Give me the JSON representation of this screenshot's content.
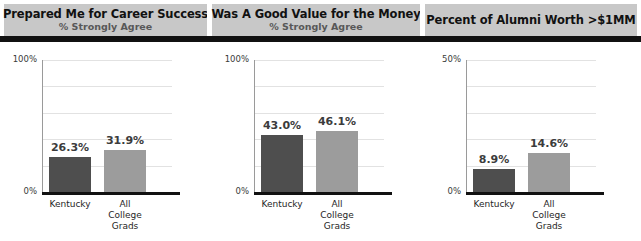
{
  "panels": [
    {
      "title": "Prepared Me for Career Success",
      "subtitle": "% Strongly Agree"
    },
    {
      "title": "Was A Good Value for the Money",
      "subtitle": "% Strongly Agree"
    },
    {
      "title": "Percent of Alumni Worth >$1MM",
      "subtitle": ""
    }
  ],
  "colors": {
    "header_background": "#c8c8c8",
    "header_rule": "#111111",
    "bar_kentucky": "#4e4e4e",
    "bar_all_college_grads": "#9c9c9c",
    "gridline": "#e2e2e2",
    "axis": "#111111"
  },
  "chart_data": [
    {
      "type": "bar",
      "title": "Prepared Me for Career Success",
      "subtitle": "% Strongly Agree",
      "categories": [
        "Kentucky",
        "All College Grads"
      ],
      "category_lines": [
        [
          "Kentucky"
        ],
        [
          "All",
          "College",
          "Grads"
        ]
      ],
      "values": [
        26.3,
        31.9
      ],
      "value_labels": [
        "26.3%",
        "31.9%"
      ],
      "ylim": [
        0,
        100
      ],
      "ytick_labels": [
        "0%",
        "100%"
      ],
      "yticks": [
        0,
        100
      ],
      "gridlines": [
        20,
        40,
        60,
        80,
        100
      ],
      "grid": true,
      "legend": "none",
      "xlabel": "",
      "ylabel": ""
    },
    {
      "type": "bar",
      "title": "Was A Good Value for the Money",
      "subtitle": "% Strongly Agree",
      "categories": [
        "Kentucky",
        "All College Grads"
      ],
      "category_lines": [
        [
          "Kentucky"
        ],
        [
          "All",
          "College",
          "Grads"
        ]
      ],
      "values": [
        43.0,
        46.1
      ],
      "value_labels": [
        "43.0%",
        "46.1%"
      ],
      "ylim": [
        0,
        100
      ],
      "ytick_labels": [
        "0%",
        "100%"
      ],
      "yticks": [
        0,
        100
      ],
      "gridlines": [
        20,
        40,
        60,
        80,
        100
      ],
      "grid": true,
      "legend": "none",
      "xlabel": "",
      "ylabel": ""
    },
    {
      "type": "bar",
      "title": "Percent of Alumni Worth >$1MM",
      "subtitle": "",
      "categories": [
        "Kentucky",
        "All College Grads"
      ],
      "category_lines": [
        [
          "Kentucky"
        ],
        [
          "All",
          "College",
          "Grads"
        ]
      ],
      "values": [
        8.9,
        14.6
      ],
      "value_labels": [
        "8.9%",
        "14.6%"
      ],
      "ylim": [
        0,
        50
      ],
      "ytick_labels": [
        "0%",
        "50%"
      ],
      "yticks": [
        0,
        50
      ],
      "gridlines": [
        10,
        20,
        30,
        40,
        50
      ],
      "grid": true,
      "legend": "none",
      "xlabel": "",
      "ylabel": ""
    }
  ]
}
